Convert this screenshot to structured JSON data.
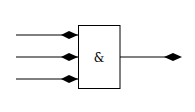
{
  "diagram": {
    "type": "logic-gate",
    "gate": {
      "kind": "AND",
      "label": "&",
      "box": {
        "x": 78,
        "y": 25,
        "width": 42,
        "height": 63
      }
    },
    "inputs": [
      {
        "id": "in1",
        "y": 35
      },
      {
        "id": "in2",
        "y": 57
      },
      {
        "id": "in3",
        "y": 79
      }
    ],
    "input_line_start_x": 16,
    "output": {
      "id": "out",
      "y": 57,
      "line_end_x": 173
    },
    "connector_icon": "diamond-connector-icon",
    "colors": {
      "stroke": "#000000",
      "background": "#ffffff"
    }
  }
}
